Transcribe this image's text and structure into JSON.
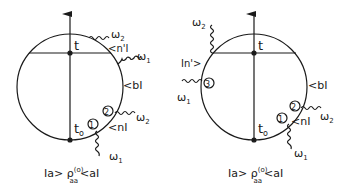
{
  "diagrams": [
    {
      "time_top_label": "t",
      "time_bottom_label": "t",
      "time_bottom_subscript": "o",
      "state_labels": {
        "n_prime": "<n'I",
        "b": "<bI",
        "n": "<nI"
      },
      "vertex_labels": [
        "1",
        "2"
      ],
      "photon_labels": [
        "ω",
        "ω",
        "ω",
        "ω"
      ],
      "photon_subscripts": [
        "2",
        "1",
        "2",
        "1"
      ],
      "density_matrix": {
        "prefix": "Ia> ρ",
        "superscript": "(o)",
        "subscript": "aa",
        "suffix": "<aI"
      }
    },
    {
      "time_top_label": "t",
      "time_bottom_label": "t",
      "time_bottom_subscript": "o",
      "state_labels": {
        "n_prime": "In'>",
        "b": "<bI",
        "n": "<nI"
      },
      "vertex_labels": [
        "3",
        "2",
        "1"
      ],
      "photon_labels": [
        "ω",
        "ω",
        "ω",
        "ω"
      ],
      "photon_subscripts": [
        "2",
        "1",
        "2",
        "1"
      ],
      "density_matrix": {
        "prefix": "Ia> ρ",
        "superscript": "(o)",
        "subscript": "aa",
        "suffix": "<aI"
      }
    }
  ]
}
